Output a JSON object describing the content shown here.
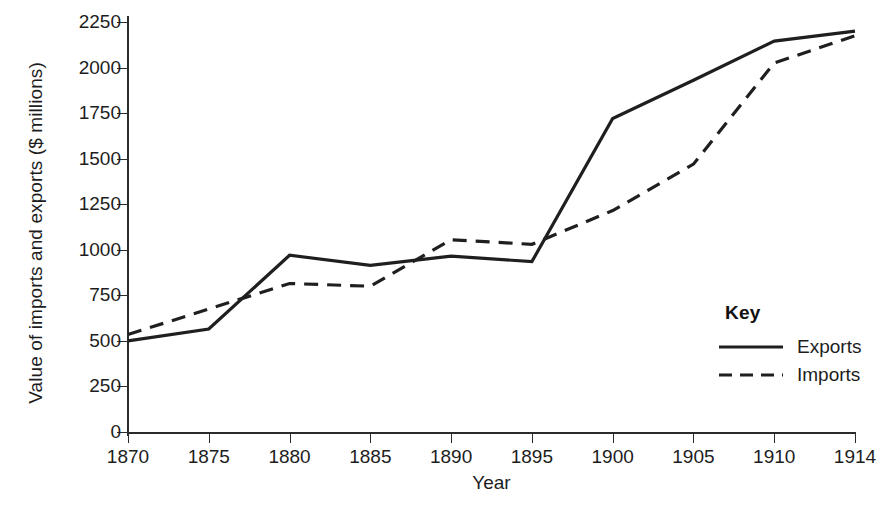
{
  "chart_data": {
    "type": "line",
    "title": "",
    "xlabel": "Year",
    "ylabel": "Value of imports and exports ($ millions)",
    "x": [
      1870,
      1875,
      1880,
      1885,
      1890,
      1895,
      1900,
      1905,
      1910,
      1914
    ],
    "categories": [
      "1870",
      "1875",
      "1880",
      "1885",
      "1890",
      "1895",
      "1900",
      "1905",
      "1910",
      "1914"
    ],
    "series": [
      {
        "name": "Exports",
        "style": "solid",
        "values": [
          500,
          565,
          970,
          915,
          965,
          935,
          1720,
          1930,
          2145,
          2200
        ]
      },
      {
        "name": "Imports",
        "style": "dashed",
        "values": [
          535,
          675,
          815,
          800,
          1055,
          1030,
          1215,
          1470,
          2025,
          2175
        ]
      }
    ],
    "ylim": [
      0,
      2250
    ],
    "yticks": [
      0,
      250,
      500,
      750,
      1000,
      1250,
      1500,
      1750,
      2000,
      2250
    ],
    "ytick_labels": [
      "0",
      "250",
      "500",
      "750",
      "1000",
      "1250",
      "1500",
      "1750",
      "2000",
      "2250"
    ],
    "xlim_index": [
      0,
      9
    ],
    "grid": false,
    "legend_position": "inside-right",
    "line_color": "#1f1f1f"
  },
  "legend": {
    "title": "Key",
    "entries": [
      {
        "label": "Exports",
        "style": "solid"
      },
      {
        "label": "Imports",
        "style": "dashed"
      }
    ]
  },
  "axes": {
    "y_title": "Value of imports and exports ($ millions)",
    "x_title": "Year"
  }
}
